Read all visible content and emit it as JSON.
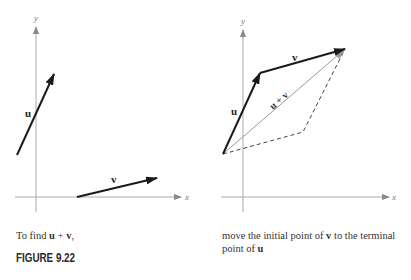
{
  "figure": {
    "label": "FIGURE 9.22",
    "left_panel": {
      "axis_labels": {
        "x": "x",
        "y": "y"
      },
      "vectors": [
        {
          "name": "u",
          "label": "u",
          "tail": [
            17,
            155
          ],
          "tip": [
            54,
            74
          ]
        },
        {
          "name": "v",
          "label": "v",
          "tail": [
            77,
            197
          ],
          "tip": [
            157,
            178
          ]
        }
      ],
      "caption": {
        "prefix": "To find ",
        "u": "u",
        "plus": " + ",
        "v": "v",
        "suffix": ","
      }
    },
    "right_panel": {
      "axis_labels": {
        "x": "x",
        "y": "y"
      },
      "vectors": [
        {
          "name": "u",
          "label": "u",
          "tail": [
            223,
            154
          ],
          "tip": [
            260,
            73
          ]
        },
        {
          "name": "v",
          "label": "v",
          "tail": [
            260,
            73
          ],
          "tip": [
            345,
            49
          ]
        },
        {
          "name": "u+v",
          "label": "u + v",
          "tail": [
            223,
            154
          ],
          "tip": [
            345,
            49
          ]
        }
      ],
      "dashed_parallelogram": [
        [
          223,
          154
        ],
        [
          303,
          132
        ],
        [
          345,
          49
        ]
      ],
      "caption": {
        "line1_a": "move the initial point of ",
        "line1_v": "v",
        "line1_b": " to the terminal",
        "line2_a": "point of ",
        "line2_u": "u"
      }
    }
  }
}
